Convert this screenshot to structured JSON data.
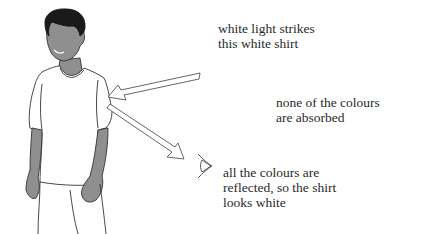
{
  "diagram": {
    "labels": {
      "incident": "white light strikes\nthis white shirt",
      "absorption": "none of the colours\nare absorbed",
      "reflection": "all the colours are\nreflected, so the shirt\nlooks white"
    },
    "elements": {
      "person": "boy wearing white t-shirt",
      "incident_arrow": "white light arrow pointing to shirt sleeve",
      "reflected_arrow": "reflected light arrow pointing to eye",
      "eye": "observer eye"
    },
    "colors": {
      "skin": "#8f8f8f",
      "hair": "#1a1a1a",
      "outline": "#333333",
      "shirt": "#ffffff",
      "arrow_fill": "#ffffff",
      "text": "#2a2a2a"
    }
  }
}
